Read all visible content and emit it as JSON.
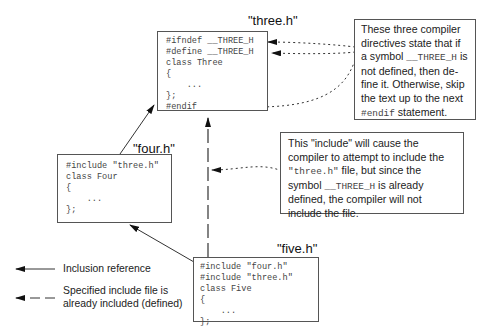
{
  "files": {
    "three": {
      "name": "\"three.h\"",
      "lines": [
        "#ifndef __THREE_H",
        "#define __THREE_H",
        "class Three",
        "{",
        "    ...",
        "};",
        "#endif"
      ]
    },
    "four": {
      "name": "\"four.h\"",
      "lines": [
        "#include \"three.h\"",
        "class Four",
        "{",
        "    ...",
        "};"
      ]
    },
    "five": {
      "name": "\"five.h\"",
      "lines": [
        "#include \"four.h\"",
        "#include \"three.h\"",
        "class Five",
        "{",
        "    ...",
        "};"
      ]
    }
  },
  "notes": {
    "directives": {
      "t1": "These three compiler directives state that if a symbol ",
      "sym": "__THREE_H",
      "t2": " is not defined, then de-fine it. Otherwise, skip the text up to the next ",
      "kw": "#endif",
      "t3": " statement."
    },
    "include": {
      "t1": "This \"include\" will cause the compiler to attempt to include the ",
      "file": "\"three.h\"",
      "t2": " file, but since the symbol ",
      "sym": "__THREE_H",
      "t3": " is already defined, the compiler will not include the file."
    }
  },
  "legend": {
    "solid_label": "Inclusion reference",
    "dashed_label": "Specified include file is already included (defined)"
  },
  "colors": {
    "line": "#333333",
    "border": "#555555",
    "code_text": "#444444"
  }
}
